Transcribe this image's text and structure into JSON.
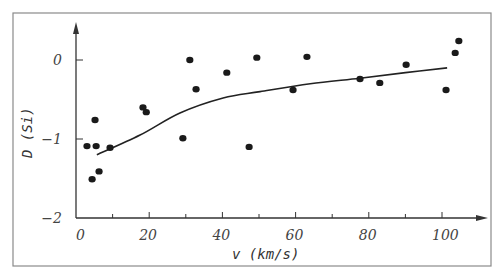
{
  "chart_data": {
    "type": "scatter",
    "title": "",
    "xlabel": "v  (km/s)",
    "ylabel": "D (Si)",
    "xlim": [
      0,
      113
    ],
    "ylim": [
      -2,
      0.5
    ],
    "x_ticks": [
      0,
      20,
      40,
      60,
      80,
      100
    ],
    "x_minor_ticks": [
      10,
      30,
      50,
      70,
      90
    ],
    "y_ticks": [
      0,
      -1,
      -2
    ],
    "x_tick_labels": [
      "0",
      "20",
      "40",
      "60",
      "80",
      "100"
    ],
    "y_tick_labels": [
      "0",
      "−1",
      "−2"
    ],
    "grid": false,
    "legend": null,
    "series": [
      {
        "name": "observations",
        "kind": "scatter",
        "points": [
          {
            "x": 3.0,
            "y": -1.09
          },
          {
            "x": 5.5,
            "y": -1.09
          },
          {
            "x": 5.2,
            "y": -0.76
          },
          {
            "x": 9.3,
            "y": -1.11
          },
          {
            "x": 6.3,
            "y": -1.41
          },
          {
            "x": 4.4,
            "y": -1.51
          },
          {
            "x": 18.3,
            "y": -0.6
          },
          {
            "x": 19.2,
            "y": -0.66
          },
          {
            "x": 29.2,
            "y": -0.99
          },
          {
            "x": 31.1,
            "y": 0.0
          },
          {
            "x": 32.8,
            "y": -0.37
          },
          {
            "x": 41.2,
            "y": -0.16
          },
          {
            "x": 47.3,
            "y": -1.1
          },
          {
            "x": 49.4,
            "y": 0.03
          },
          {
            "x": 59.3,
            "y": -0.38
          },
          {
            "x": 63.1,
            "y": 0.04
          },
          {
            "x": 77.6,
            "y": -0.24
          },
          {
            "x": 83.0,
            "y": -0.29
          },
          {
            "x": 90.2,
            "y": -0.06
          },
          {
            "x": 101.1,
            "y": -0.38
          },
          {
            "x": 103.6,
            "y": 0.09
          },
          {
            "x": 104.6,
            "y": 0.24
          }
        ]
      },
      {
        "name": "fit",
        "kind": "line",
        "points": [
          {
            "x": 5.7,
            "y": -1.2
          },
          {
            "x": 17.5,
            "y": -0.95
          },
          {
            "x": 28.4,
            "y": -0.67
          },
          {
            "x": 40.2,
            "y": -0.48
          },
          {
            "x": 50.3,
            "y": -0.4
          },
          {
            "x": 64.0,
            "y": -0.3
          },
          {
            "x": 77.6,
            "y": -0.23
          },
          {
            "x": 90.0,
            "y": -0.16
          },
          {
            "x": 101.4,
            "y": -0.1
          }
        ]
      }
    ]
  },
  "layout": {
    "frame": {
      "x": 13,
      "y": 13,
      "w": 478,
      "h": 253
    },
    "origin_px": {
      "x": 76,
      "y": 218
    },
    "x_px_per_unit": 3.66,
    "y_px_per_unit": 79,
    "x_axis_end_px": 488,
    "y_axis_top_px": 22,
    "colors": {
      "axis": "#333333",
      "point": "#1a1a1a",
      "frame": "#8a8a8a",
      "curve": "#222222"
    }
  }
}
